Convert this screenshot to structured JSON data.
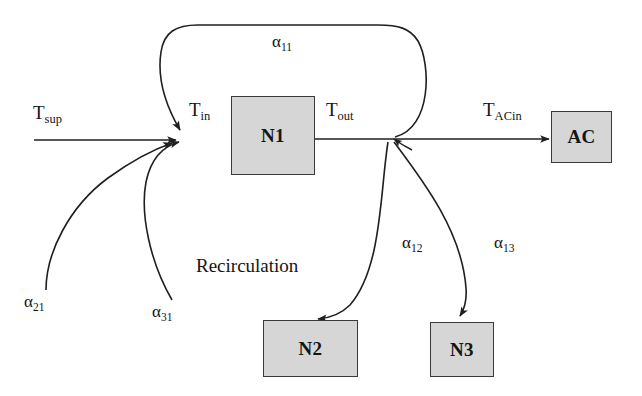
{
  "diagram": {
    "title": "Recirculation",
    "kind": "airflow-recirculation-block-diagram",
    "colors": {
      "box_fill": "#d6d6d6",
      "box_stroke": "#3a3a3a",
      "line": "#1f1f1f",
      "text": "#141414",
      "background": "#ffffff"
    },
    "nodes": [
      {
        "id": "N1",
        "label": "N1",
        "x": 231,
        "y": 96,
        "w": 84,
        "h": 79
      },
      {
        "id": "AC",
        "label": "AC",
        "x": 551,
        "y": 111,
        "w": 61,
        "h": 52
      },
      {
        "id": "N2",
        "label": "N2",
        "x": 263,
        "y": 320,
        "w": 95,
        "h": 57
      },
      {
        "id": "N3",
        "label": "N3",
        "x": 430,
        "y": 322,
        "w": 64,
        "h": 55
      }
    ],
    "temperature_labels": [
      {
        "id": "T_sup",
        "base": "T",
        "sub": "sup",
        "x": 33,
        "y": 103
      },
      {
        "id": "T_in",
        "base": "T",
        "sub": "in",
        "x": 189,
        "y": 100
      },
      {
        "id": "T_out",
        "base": "T",
        "sub": "out",
        "x": 326,
        "y": 100
      },
      {
        "id": "T_ACin",
        "base": "T",
        "sub": "ACin",
        "x": 483,
        "y": 100
      }
    ],
    "coefficient_labels": [
      {
        "id": "alpha_11",
        "base": "α",
        "sub": "11",
        "x": 272,
        "y": 33
      },
      {
        "id": "alpha_12",
        "base": "α",
        "sub": "12",
        "x": 402,
        "y": 234
      },
      {
        "id": "alpha_13",
        "base": "α",
        "sub": "13",
        "x": 494,
        "y": 234
      },
      {
        "id": "alpha_21",
        "base": "α",
        "sub": "21",
        "x": 24,
        "y": 293
      },
      {
        "id": "alpha_31",
        "base": "α",
        "sub": "31",
        "x": 152,
        "y": 303
      }
    ],
    "annotation": {
      "id": "recirculation",
      "text": "Recirculation",
      "x": 196,
      "y": 256
    },
    "edges": [
      {
        "id": "supply-inlet",
        "from": "T_sup",
        "to": "T_in",
        "style": "straight",
        "label": null
      },
      {
        "id": "n1-outlet",
        "from": "N1",
        "to": "T_out",
        "style": "straight",
        "label": null
      },
      {
        "id": "outlet-to-ac",
        "from": "T_out",
        "to": "AC",
        "style": "straight",
        "label": "T_ACin"
      },
      {
        "id": "recirc-n1-to-n1",
        "from": "T_out",
        "to": "T_in",
        "style": "curved-top-loop",
        "label": "alpha_11"
      },
      {
        "id": "recirc-n1-to-n2",
        "from": "T_out",
        "to": "N2",
        "style": "curved",
        "label": "alpha_12"
      },
      {
        "id": "recirc-n1-to-n3",
        "from": "T_out",
        "to": "N3",
        "style": "curved",
        "label": "alpha_13"
      },
      {
        "id": "recirc-n2-to-n1",
        "from": "N2",
        "to": "T_in",
        "style": "curved",
        "label": "alpha_21"
      },
      {
        "id": "recirc-n3-to-n1",
        "from": "N3",
        "to": "T_in",
        "style": "curved",
        "label": "alpha_31"
      }
    ]
  }
}
